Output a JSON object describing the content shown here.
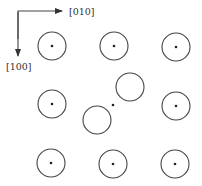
{
  "diagram": {
    "axes": {
      "horizontal_label": "[010]",
      "vertical_label": "[100]"
    },
    "lattice_sites": [
      {
        "row": 1,
        "col": 1,
        "type": "normal"
      },
      {
        "row": 1,
        "col": 2,
        "type": "normal"
      },
      {
        "row": 1,
        "col": 3,
        "type": "normal"
      },
      {
        "row": 2,
        "col": 1,
        "type": "normal"
      },
      {
        "row": 2,
        "col": 2,
        "type": "split-interstitial"
      },
      {
        "row": 2,
        "col": 3,
        "type": "normal"
      },
      {
        "row": 3,
        "col": 1,
        "type": "normal"
      },
      {
        "row": 3,
        "col": 2,
        "type": "normal"
      },
      {
        "row": 3,
        "col": 3,
        "type": "normal"
      }
    ]
  }
}
